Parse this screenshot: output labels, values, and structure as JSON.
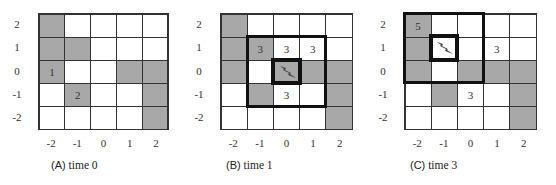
{
  "colors": {
    "occupied": "#a8a8a8",
    "free": "#ffffff",
    "border": "#333333",
    "highlight_border": "#111111"
  },
  "axis": {
    "y_ticks": [
      "2",
      "1",
      "0",
      "-1",
      "-2"
    ],
    "x_ticks": [
      "-2",
      "-1",
      "0",
      "1",
      "2"
    ]
  },
  "panels": [
    {
      "id": "A",
      "caption_letter": "(A)",
      "caption_text": "time 0",
      "cells": [
        [
          "gray",
          "white",
          "white",
          "white",
          "white"
        ],
        [
          "gray",
          "gray",
          "white",
          "white",
          "white"
        ],
        [
          "gray",
          "white",
          "white",
          "gray",
          "gray"
        ],
        [
          "white",
          "gray",
          "white",
          "white",
          "gray"
        ],
        [
          "white",
          "white",
          "white",
          "white",
          "gray"
        ]
      ],
      "labels": {
        "2_0": "1",
        "3_1": "2"
      },
      "agent": null,
      "window": null
    },
    {
      "id": "B",
      "caption_letter": "(B)",
      "caption_text": "time 1",
      "cells": [
        [
          "gray",
          "white",
          "white",
          "white",
          "white"
        ],
        [
          "gray",
          "gray",
          "white",
          "white",
          "white"
        ],
        [
          "gray",
          "white",
          "gray",
          "gray",
          "gray"
        ],
        [
          "white",
          "gray",
          "white",
          "white",
          "gray"
        ],
        [
          "white",
          "white",
          "white",
          "white",
          "gray"
        ]
      ],
      "labels": {
        "1_1": "3",
        "1_2": "3",
        "1_3": "3",
        "3_2": "3"
      },
      "agent": {
        "row": 2,
        "col": 2,
        "icon": "lightning-bolt-icon"
      },
      "window": {
        "row": 1,
        "col": 1,
        "size": 3
      }
    },
    {
      "id": "C",
      "caption_letter": "(C)",
      "caption_text": "time 3",
      "cells": [
        [
          "gray",
          "white",
          "white",
          "white",
          "white"
        ],
        [
          "gray",
          "white",
          "white",
          "white",
          "white"
        ],
        [
          "gray",
          "white",
          "gray",
          "gray",
          "gray"
        ],
        [
          "white",
          "gray",
          "white",
          "white",
          "gray"
        ],
        [
          "white",
          "white",
          "white",
          "white",
          "gray"
        ]
      ],
      "labels": {
        "0_0": "5",
        "1_3": "3",
        "3_2": "3"
      },
      "agent": {
        "row": 1,
        "col": 1,
        "icon": "lightning-bolt-icon"
      },
      "window": {
        "row": 0,
        "col": 0,
        "size": 3
      }
    }
  ]
}
